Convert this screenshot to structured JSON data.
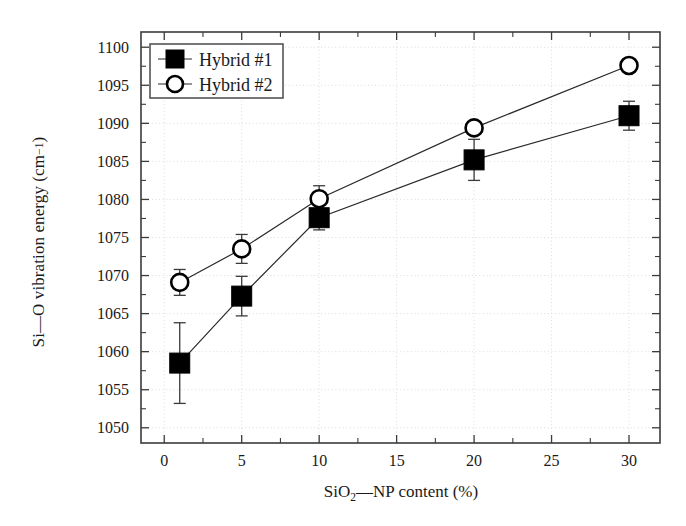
{
  "chart_data": {
    "type": "line",
    "title": "",
    "xlabel": "SiO2—NP content (%)",
    "ylabel": "Si—O vibration energy (cm-1)",
    "xlabel_parts": {
      "pre": "SiO",
      "sub": "2",
      "post": "—NP content (%)"
    },
    "ylabel_parts": {
      "pre": "Si—O vibration energy (cm",
      "sup": "−1",
      "post": ")"
    },
    "x": [
      1,
      5,
      10,
      20,
      30
    ],
    "xlim": [
      -1.5,
      32
    ],
    "ylim": [
      1048,
      1102
    ],
    "xticks": [
      0,
      5,
      10,
      15,
      20,
      25,
      30
    ],
    "xticklabels": [
      "0",
      "5",
      "10",
      "15",
      "20",
      "25",
      "30"
    ],
    "yticks": [
      1050,
      1055,
      1060,
      1065,
      1070,
      1075,
      1080,
      1085,
      1090,
      1095,
      1100
    ],
    "yticklabels": [
      "1050",
      "1055",
      "1060",
      "1065",
      "1070",
      "1075",
      "1080",
      "1085",
      "1090",
      "1095",
      "1100"
    ],
    "x_minor_step": 2.5,
    "y_minor_step": 2.5,
    "grid": true,
    "grid_style": "dotted",
    "legend_position": "upper left",
    "series": [
      {
        "name": "Hybrid #1",
        "marker": "filled-square",
        "color": "#000000",
        "values": [
          1058.5,
          1067.3,
          1077.6,
          1085.2,
          1091.0
        ],
        "yerr": [
          5.3,
          2.6,
          1.6,
          2.7,
          1.9
        ]
      },
      {
        "name": "Hybrid #2",
        "marker": "open-circle",
        "color": "#000000",
        "values": [
          1069.1,
          1073.5,
          1080.1,
          1089.4,
          1097.6
        ],
        "yerr": [
          1.7,
          1.9,
          1.7,
          0.0,
          0.0
        ]
      }
    ]
  },
  "legend": {
    "entries": [
      {
        "label": "Hybrid #1"
      },
      {
        "label": "Hybrid #2"
      }
    ]
  }
}
